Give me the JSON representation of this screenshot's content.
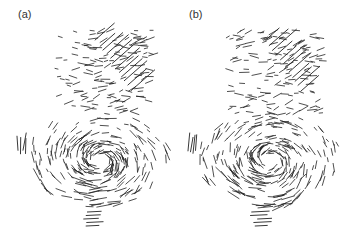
{
  "figure": {
    "panels": [
      {
        "id": "a",
        "label": "(a)",
        "description": "vector field (quiver) plot"
      },
      {
        "id": "b",
        "label": "(b)",
        "description": "vector field (quiver) plot"
      }
    ],
    "colors": {
      "background": "#ffffff",
      "vectors": "#222222",
      "label": "#333333"
    }
  }
}
